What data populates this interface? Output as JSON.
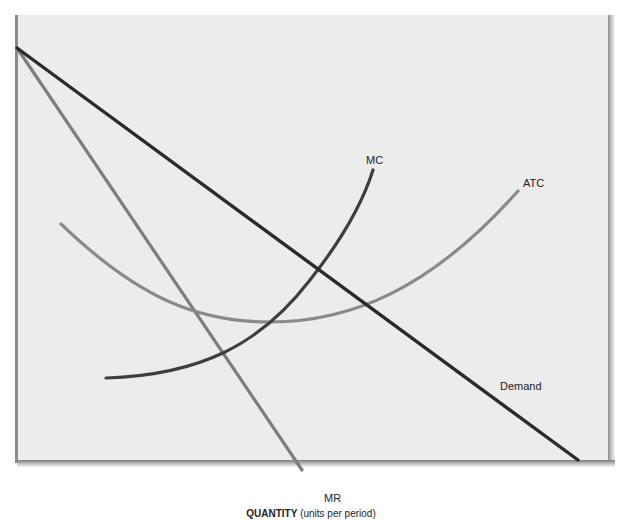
{
  "diagram": {
    "type": "economics-cost-revenue-diagram",
    "x_axis_label_bold": "QUANTITY",
    "x_axis_label_rest": " (units per period)",
    "curves": {
      "demand": {
        "label": "Demand",
        "color": "#2b2b2b"
      },
      "mr": {
        "label": "MR",
        "color": "#7d7d7d"
      },
      "mc": {
        "label": "MC",
        "color": "#3e3e3e"
      },
      "atc": {
        "label": "ATC",
        "color": "#8a8a8a"
      }
    },
    "colors": {
      "plot_background": "#ececec",
      "axis": "#8c8c8c"
    }
  }
}
